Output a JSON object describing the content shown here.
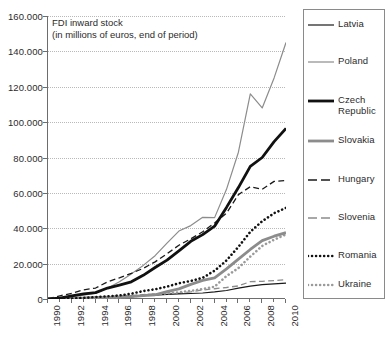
{
  "chart_data": {
    "type": "line",
    "title": "FDI inward stock",
    "subtitle": "(in millions of euros, end of period)",
    "xlabel": "",
    "ylabel": "",
    "xlim": [
      1990,
      2010
    ],
    "ylim": [
      0,
      160000
    ],
    "ytick_step": 20000,
    "grid": true,
    "legend_position": "right",
    "x": [
      1990,
      1991,
      1992,
      1993,
      1994,
      1995,
      1996,
      1997,
      1998,
      1999,
      2000,
      2001,
      2002,
      2003,
      2004,
      2005,
      2006,
      2007,
      2008,
      2009,
      2010
    ],
    "ytick_labels": [
      "0",
      "20.000",
      "40.000",
      "60.000",
      "80.000",
      "100.000",
      "120.000",
      "140.000",
      "160.000"
    ],
    "ytick_values": [
      0,
      20000,
      40000,
      60000,
      80000,
      100000,
      120000,
      140000,
      160000
    ],
    "xtick_labels": [
      "1990",
      "1992",
      "1994",
      "1996",
      "1998",
      "2000",
      "2002",
      "2004",
      "2006",
      "2008",
      "2010"
    ],
    "xtick_values": [
      1990,
      1992,
      1994,
      1996,
      1998,
      2000,
      2002,
      2004,
      2006,
      2008,
      2010
    ],
    "series": [
      {
        "name": "Latvia",
        "style": "solid",
        "color": "#1a1a1a",
        "width": 1.2,
        "values": [
          0,
          60,
          200,
          400,
          700,
          1000,
          1300,
          1700,
          2000,
          2200,
          2600,
          2900,
          3100,
          3400,
          4000,
          4800,
          6100,
          7300,
          8100,
          8600,
          9000
        ]
      },
      {
        "name": "Poland",
        "style": "solid",
        "color": "#8c8c8c",
        "width": 1.2,
        "values": [
          100,
          400,
          1300,
          2200,
          3300,
          6100,
          9700,
          14200,
          19000,
          24500,
          31600,
          38400,
          41500,
          46200,
          46000,
          62000,
          83000,
          116000,
          108000,
          125000,
          145000
        ]
      },
      {
        "name": "Czech Republic",
        "style": "solid",
        "color": "#111111",
        "width": 2.8,
        "values": [
          0,
          500,
          1800,
          2900,
          3600,
          6200,
          7900,
          9700,
          13400,
          17800,
          22000,
          27200,
          32600,
          36400,
          41200,
          51800,
          63000,
          75000,
          80000,
          89000,
          96500
        ]
      },
      {
        "name": "Slovakia",
        "style": "solid",
        "color": "#8c8c8c",
        "width": 2.8,
        "values": [
          0,
          100,
          300,
          500,
          700,
          900,
          1100,
          1400,
          1900,
          2400,
          4200,
          5700,
          8300,
          10500,
          12000,
          17000,
          22500,
          28000,
          33000,
          35500,
          37500
        ]
      },
      {
        "name": "Hungary",
        "style": "dashed",
        "color": "#1a1a1a",
        "width": 1.3,
        "values": [
          200,
          1800,
          3200,
          5200,
          6200,
          9700,
          12000,
          14500,
          17300,
          21000,
          25600,
          30400,
          34000,
          38000,
          43000,
          48500,
          59000,
          63500,
          62000,
          66500,
          67000
        ]
      },
      {
        "name": "Slovenia",
        "style": "dashed",
        "color": "#8c8c8c",
        "width": 1.3,
        "values": [
          0,
          400,
          700,
          900,
          1200,
          1500,
          1800,
          2100,
          2400,
          2700,
          3000,
          3200,
          4000,
          5100,
          5800,
          6500,
          7400,
          9800,
          10000,
          10400,
          11000
        ]
      },
      {
        "name": "Romania",
        "style": "dotted",
        "color": "#111111",
        "width": 2.6,
        "values": [
          0,
          100,
          300,
          600,
          1100,
          1500,
          2000,
          3000,
          4500,
          5500,
          7000,
          8900,
          10200,
          12000,
          16000,
          21800,
          29500,
          38000,
          44000,
          48500,
          51500
        ]
      },
      {
        "name": "Ukraine",
        "style": "dotted",
        "color": "#9a9a9a",
        "width": 2.6,
        "values": [
          0,
          50,
          150,
          300,
          500,
          700,
          1000,
          1500,
          2100,
          2600,
          3200,
          3800,
          4600,
          5600,
          7000,
          13000,
          17500,
          24000,
          30000,
          33500,
          36500
        ]
      }
    ]
  },
  "legend": {
    "items": [
      {
        "label": "Latvia"
      },
      {
        "label": "Poland"
      },
      {
        "label": "Czech"
      },
      {
        "label": "Republic"
      },
      {
        "label": "Slovakia"
      },
      {
        "label": "Hungary"
      },
      {
        "label": "Slovenia"
      },
      {
        "label": "Romania"
      },
      {
        "label": "Ukraine"
      }
    ]
  }
}
